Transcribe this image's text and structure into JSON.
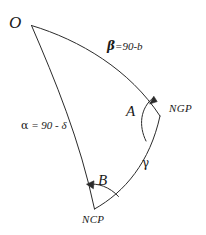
{
  "diagram": {
    "type": "spherical-triangle",
    "title": "",
    "background_color": "#ffffff",
    "stroke_color": "#2b2b2b",
    "text_color": "#1a1a1a",
    "vertices": [
      {
        "key": "O",
        "label": "O",
        "x": 31,
        "y": 25,
        "label_x": 9,
        "label_y": 14
      },
      {
        "key": "NGP",
        "label": "NGP",
        "x": 160,
        "y": 116,
        "label_x": 169,
        "label_y": 103
      },
      {
        "key": "NCP",
        "label": "NCP",
        "x": 94,
        "y": 209,
        "label_x": 82,
        "label_y": 214
      }
    ],
    "sides": [
      {
        "key": "beta",
        "from": "O",
        "to": "NGP",
        "symbol": "β",
        "equals": "=90-b",
        "label": "β =90-b",
        "label_x": 107,
        "label_y": 40
      },
      {
        "key": "alpha",
        "from": "O",
        "to": "NCP",
        "symbol": "α",
        "equals": " = 90 - δ",
        "label": "α = 90 - δ",
        "label_x": 21,
        "label_y": 120
      },
      {
        "key": "gamma",
        "from": "NCP",
        "to": "NGP",
        "symbol": "γ",
        "equals": "",
        "label": "γ",
        "label_x": 142,
        "label_y": 157
      }
    ],
    "angles": [
      {
        "key": "A",
        "label": "A",
        "at": "NGP",
        "label_x": 126,
        "label_y": 104,
        "has_arrow": true
      },
      {
        "key": "B",
        "label": "B",
        "at": "NCP",
        "label_x": 98,
        "label_y": 173,
        "has_arrow": true
      }
    ]
  }
}
